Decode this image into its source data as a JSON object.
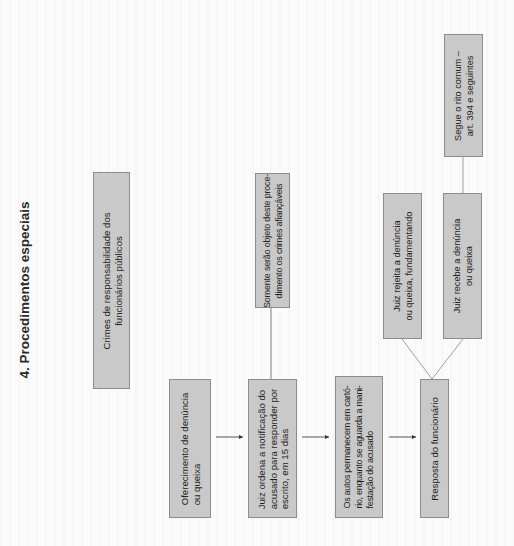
{
  "section_title": "4. Procedimentos especiais",
  "colors": {
    "box_fill": "#c9c9c9",
    "box_border": "#8c8c8c",
    "line": "#6e6e6e",
    "background": "#fbfbfb"
  },
  "nodes": {
    "crimes": {
      "text": "Crimes de responsabilidade dos\nfuncionários públicos"
    },
    "oferecimento": {
      "text": "Oferecimento de denúncia\nou queixa"
    },
    "juiz_ordena": {
      "text": "Juiz ordena a notificação do\nacusado para responder por\nescrito, em 15 dias"
    },
    "somente": {
      "text": "Somente serão objeto deste proce-\ndimento os crimes afiançáveis"
    },
    "autos": {
      "text": "Os autos permanecem em cartó-\nrio, enquanto se aguarda a mani-\nfestação do acusado"
    },
    "resposta": {
      "text": "Resposta do funcionário"
    },
    "rejeita": {
      "text": "Juiz rejeita a denúncia\nou queixa, fundamentando"
    },
    "recebe": {
      "text": "Juiz recebe a denúncia\nou queixa"
    },
    "segue": {
      "text": "Segue o rito comum –\nart. 394 e seguintes"
    }
  },
  "edges": [
    {
      "from": "oferecimento",
      "to": "juiz_ordena",
      "type": "arrow"
    },
    {
      "from": "juiz_ordena",
      "to": "autos",
      "type": "arrow"
    },
    {
      "from": "autos",
      "to": "resposta",
      "type": "arrow"
    },
    {
      "from": "juiz_ordena",
      "to": "somente",
      "type": "line"
    },
    {
      "from": "resposta",
      "to": "rejeita",
      "type": "line"
    },
    {
      "from": "resposta",
      "to": "recebe",
      "type": "line"
    },
    {
      "from": "recebe",
      "to": "segue",
      "type": "line"
    }
  ]
}
